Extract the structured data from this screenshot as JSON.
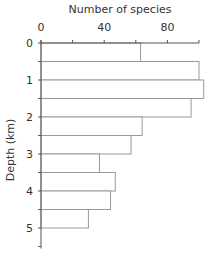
{
  "chart_data": {
    "type": "bar",
    "orientation": "horizontal",
    "title": "",
    "xlabel": "Number of species",
    "ylabel": "Depth (km)",
    "xlim": [
      0,
      100
    ],
    "ylim": [
      0,
      5.5
    ],
    "x_ticks": [
      0,
      20,
      40,
      60,
      80,
      100
    ],
    "x_tick_labels": [
      "0",
      "40",
      "80"
    ],
    "x_tick_label_values": [
      0,
      40,
      80
    ],
    "y_ticks": [
      0,
      0.5,
      1,
      1.5,
      2,
      2.5,
      3,
      3.5,
      4,
      4.5,
      5,
      5.5
    ],
    "y_tick_labels": [
      "0",
      "1",
      "2",
      "3",
      "4",
      "5"
    ],
    "y_tick_label_values": [
      0,
      1,
      2,
      3,
      4,
      5
    ],
    "x_axis_position": "top",
    "y_inverted": true,
    "grid": false,
    "legend": null,
    "categories": [
      "0-0.5",
      "0.5-1",
      "1-1.5",
      "1.5-2",
      "2-2.5",
      "2.5-3",
      "3-3.5",
      "3.5-4",
      "4-4.5",
      "4.5-5"
    ],
    "bins": [
      {
        "from": 0,
        "to": 0.5,
        "value": 63
      },
      {
        "from": 0.5,
        "to": 1,
        "value": 100
      },
      {
        "from": 1,
        "to": 1.5,
        "value": 103
      },
      {
        "from": 1.5,
        "to": 2,
        "value": 95
      },
      {
        "from": 2,
        "to": 2.5,
        "value": 64
      },
      {
        "from": 2.5,
        "to": 3,
        "value": 57
      },
      {
        "from": 3,
        "to": 3.5,
        "value": 37
      },
      {
        "from": 3.5,
        "to": 4,
        "value": 47
      },
      {
        "from": 4,
        "to": 4.5,
        "value": 44
      },
      {
        "from": 4.5,
        "to": 5,
        "value": 30
      }
    ],
    "values": [
      63,
      100,
      103,
      95,
      64,
      57,
      37,
      47,
      44,
      30
    ]
  },
  "style": {
    "bar_fill": "#ffffff",
    "bar_stroke": "#9a9a9a",
    "axis_color": "#555555",
    "text_color": "#333333"
  }
}
